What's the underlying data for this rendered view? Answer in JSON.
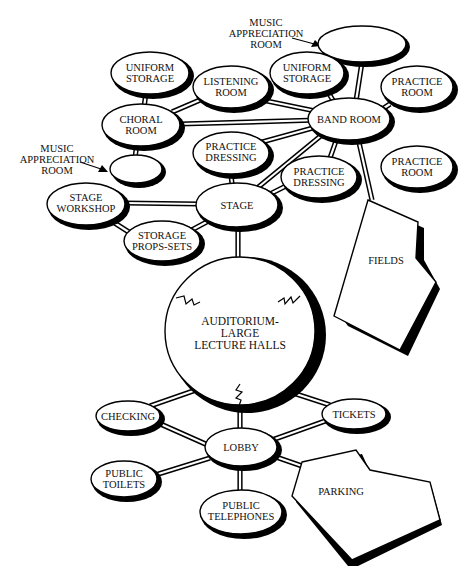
{
  "diagram": {
    "type": "bubble-adjacency-diagram",
    "nodes": {
      "music_appreciation_top": {
        "label": "",
        "callout": [
          "MUSIC",
          "APPRECIATION",
          "ROOM"
        ]
      },
      "uniform_storage_left": {
        "label": [
          "UNIFORM",
          "STORAGE"
        ]
      },
      "listening_room": {
        "label": [
          "LISTENING",
          "ROOM"
        ]
      },
      "uniform_storage_right": {
        "label": [
          "UNIFORM",
          "STORAGE"
        ]
      },
      "practice_room_1": {
        "label": [
          "PRACTICE",
          "ROOM"
        ]
      },
      "choral_room": {
        "label": [
          "CHORAL",
          "ROOM"
        ]
      },
      "band_room": {
        "label": [
          "BAND ROOM"
        ]
      },
      "practice_room_2": {
        "label": [
          "PRACTICE",
          "ROOM"
        ]
      },
      "music_appreciation_left": {
        "label": "",
        "callout": [
          "MUSIC",
          "APPRECIATION",
          "ROOM"
        ]
      },
      "practice_dressing_1": {
        "label": [
          "PRACTICE",
          "DRESSING"
        ]
      },
      "practice_dressing_2": {
        "label": [
          "PRACTICE",
          "DRESSING"
        ]
      },
      "stage_workshop": {
        "label": [
          "STAGE",
          "WORKSHOP"
        ]
      },
      "stage": {
        "label": [
          "STAGE"
        ]
      },
      "storage_props_sets": {
        "label": [
          "STORAGE",
          "PROPS-SETS"
        ]
      },
      "fields": {
        "label": [
          "FIELDS"
        ]
      },
      "auditorium": {
        "label": [
          "AUDITORIUM-",
          "LARGE",
          "LECTURE HALLS"
        ]
      },
      "checking": {
        "label": [
          "CHECKING"
        ]
      },
      "tickets": {
        "label": [
          "TICKETS"
        ]
      },
      "lobby": {
        "label": [
          "LOBBY"
        ]
      },
      "public_toilets": {
        "label": [
          "PUBLIC",
          "TOILETS"
        ]
      },
      "public_telephones": {
        "label": [
          "PUBLIC",
          "TELEPHONES"
        ]
      },
      "parking": {
        "label": [
          "PARKING"
        ]
      }
    },
    "connections": [
      [
        "uniform_storage_left",
        "choral_room"
      ],
      [
        "choral_room",
        "listening_room"
      ],
      [
        "choral_room",
        "band_room"
      ],
      [
        "choral_room",
        "music_appreciation_left"
      ],
      [
        "listening_room",
        "band_room"
      ],
      [
        "uniform_storage_right",
        "band_room"
      ],
      [
        "music_appreciation_top",
        "band_room"
      ],
      [
        "practice_room_1",
        "band_room"
      ],
      [
        "practice_dressing_1",
        "band_room"
      ],
      [
        "practice_dressing_1",
        "stage"
      ],
      [
        "stage",
        "band_room"
      ],
      [
        "practice_dressing_2",
        "band_room"
      ],
      [
        "practice_dressing_2",
        "stage"
      ],
      [
        "band_room",
        "fields"
      ],
      [
        "stage_workshop",
        "stage"
      ],
      [
        "stage_workshop",
        "storage_props_sets"
      ],
      [
        "storage_props_sets",
        "stage"
      ],
      [
        "stage",
        "auditorium"
      ],
      [
        "auditorium",
        "lobby"
      ],
      [
        "auditorium",
        "checking"
      ],
      [
        "auditorium",
        "tickets"
      ],
      [
        "checking",
        "lobby"
      ],
      [
        "tickets",
        "lobby"
      ],
      [
        "lobby",
        "public_toilets"
      ],
      [
        "lobby",
        "public_telephones"
      ],
      [
        "lobby",
        "parking"
      ]
    ]
  },
  "caption": ""
}
